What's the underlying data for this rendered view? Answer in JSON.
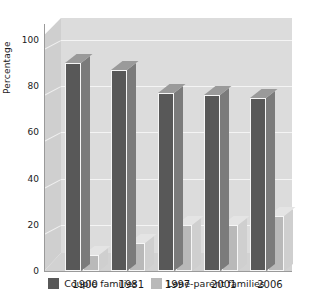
{
  "chart_data": {
    "type": "bar",
    "title": "",
    "subtitle": "",
    "xlabel": "",
    "ylabel": "Percentage",
    "ylim": [
      0,
      100
    ],
    "yticks": [
      0,
      20,
      40,
      60,
      80,
      100
    ],
    "ytick_labels": [
      "0",
      "20",
      "40",
      "60",
      "80",
      "100"
    ],
    "grid": true,
    "legend_position": "bottom",
    "style": "3d-column",
    "categories": [
      "1900",
      "1981",
      "1997",
      "2001",
      "2006"
    ],
    "series": [
      {
        "name": "Couple families",
        "color": "#585858",
        "values": [
          90,
          87,
          77,
          76,
          75
        ]
      },
      {
        "name": "Lone-parent families",
        "color": "#b9b9b9",
        "values": [
          7,
          12,
          20,
          20,
          24
        ]
      }
    ]
  },
  "axis": {
    "y_title": "Percentage",
    "y_ticks": [
      "100",
      "80",
      "60",
      "40",
      "20",
      "0"
    ],
    "x_ticks": [
      "1900",
      "1981",
      "1997",
      "2001",
      "2006"
    ]
  },
  "legend": {
    "items": [
      {
        "label": "Couple families",
        "swatch": "dark-sw"
      },
      {
        "label": "Lone-parent families",
        "swatch": "light-sw"
      }
    ]
  },
  "colors": {
    "couple_families": "#585858",
    "lone_parent_families": "#b9b9b9",
    "plot_background": "#dcdcdc",
    "floor": "#cfcfcf",
    "gridline": "#f4f4f4",
    "axis": "#9a9a9a",
    "text": "#1a1a1a"
  }
}
